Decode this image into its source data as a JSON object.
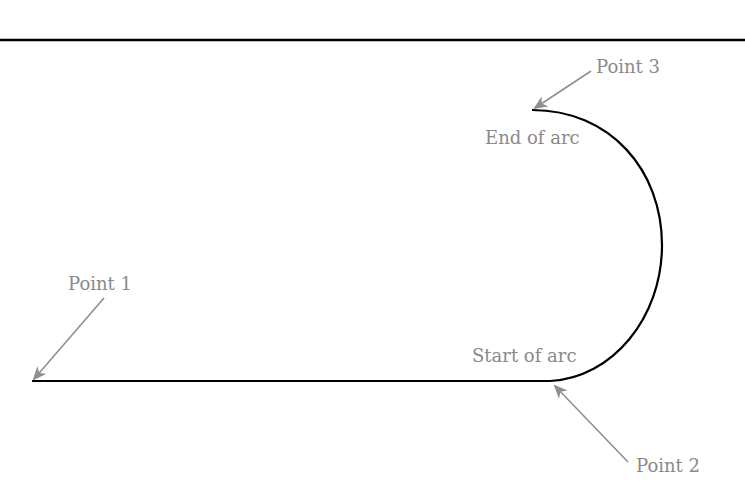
{
  "diagram": {
    "type": "path-with-arc",
    "colors": {
      "line": "#000000",
      "annotation": "#8f8f8f",
      "label": "#8a8a8a",
      "background": "#ffffff"
    },
    "labels": {
      "point1": "Point 1",
      "point2": "Point 2",
      "point3": "Point 3",
      "start_of_arc": "Start of arc",
      "end_of_arc": "End of arc"
    },
    "points": [
      {
        "id": "point1",
        "label": "Point 1",
        "x": 32,
        "y": 381
      },
      {
        "id": "point2",
        "label": "Point 2",
        "x": 550,
        "y": 381
      },
      {
        "id": "point3",
        "label": "Point 3",
        "x": 532,
        "y": 110
      }
    ]
  }
}
